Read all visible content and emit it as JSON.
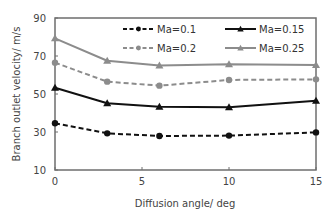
{
  "chart_data": {
    "type": "line",
    "title": "",
    "xlabel": "Diffusion angle/ deg",
    "ylabel": "Branch outlet velocity/ m/s",
    "xlim": [
      0,
      15
    ],
    "ylim": [
      10,
      90
    ],
    "xticks": [
      0,
      5,
      10,
      15
    ],
    "yticks": [
      10,
      30,
      50,
      70,
      90
    ],
    "grid": false,
    "legend_position": "top-inside, 2 columns",
    "x": [
      0,
      3,
      6,
      10,
      15
    ],
    "series": [
      {
        "name": "Ma=0.1",
        "values": [
          34.6,
          29.3,
          27.9,
          28.1,
          29.8
        ],
        "color": "#111111",
        "dash": "5,3",
        "marker": "circle",
        "width": 2
      },
      {
        "name": "Ma=0.15",
        "values": [
          53.3,
          45.1,
          43.3,
          43.0,
          46.5
        ],
        "color": "#111111",
        "dash": "",
        "marker": "triangle",
        "width": 2
      },
      {
        "name": "Ma=0.2",
        "values": [
          66.5,
          56.5,
          54.4,
          57.4,
          57.7
        ],
        "color": "#8c8c8c",
        "dash": "5,3",
        "marker": "circle",
        "width": 2
      },
      {
        "name": "Ma=0.25",
        "values": [
          79.3,
          67.5,
          65.0,
          65.6,
          65.3
        ],
        "color": "#8c8c8c",
        "dash": "",
        "marker": "triangle",
        "width": 2
      }
    ]
  },
  "legend": {
    "items": [
      {
        "label": "Ma=0.1"
      },
      {
        "label": "Ma=0.15"
      },
      {
        "label": "Ma=0.2"
      },
      {
        "label": "Ma=0.25"
      }
    ]
  }
}
